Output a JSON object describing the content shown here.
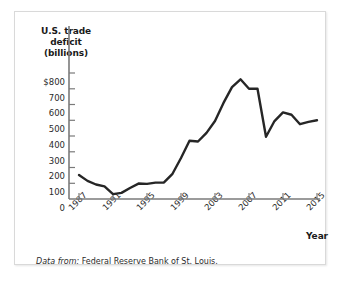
{
  "figure": {
    "source_prefix": "Data from:",
    "source_text": " Federal Reserve Bank of St. Louis.",
    "frame_color": "#d9d9d9",
    "background": "#ffffff"
  },
  "chart_data": {
    "type": "line",
    "title": "",
    "ylabel": "U.S. trade deficit (billions)",
    "ylabel_lines": [
      "U.S. trade",
      "deficit",
      "(billions)"
    ],
    "xlabel": "Year",
    "line_color": "#262626",
    "axis_color": "#7a7a7a",
    "grid": false,
    "legend": null,
    "xlim": [
      1986,
      2016
    ],
    "ylim": [
      0,
      830
    ],
    "ytick_labels": [
      "$800",
      "700",
      "600",
      "500",
      "400",
      "300",
      "200",
      "100",
      "0"
    ],
    "ytick_values": [
      800,
      700,
      600,
      500,
      400,
      300,
      200,
      100,
      0
    ],
    "xtick_labels": [
      "1987",
      "1991",
      "1995",
      "1999",
      "2003",
      "2007",
      "2011",
      "2015"
    ],
    "xtick_values": [
      1987,
      1991,
      1995,
      1999,
      2003,
      2007,
      2011,
      2015
    ],
    "x": [
      1987,
      1988,
      1989,
      1990,
      1991,
      1992,
      1993,
      1994,
      1995,
      1996,
      1997,
      1998,
      1999,
      2000,
      2001,
      2002,
      2003,
      2004,
      2005,
      2006,
      2007,
      2008,
      2009,
      2010,
      2011,
      2012,
      2013,
      2014,
      2015
    ],
    "values": [
      153,
      115,
      92,
      80,
      31,
      39,
      70,
      98,
      96,
      104,
      105,
      160,
      260,
      370,
      365,
      420,
      495,
      610,
      710,
      760,
      700,
      700,
      395,
      495,
      550,
      535,
      475,
      490,
      500
    ],
    "units": "billions of dollars"
  }
}
